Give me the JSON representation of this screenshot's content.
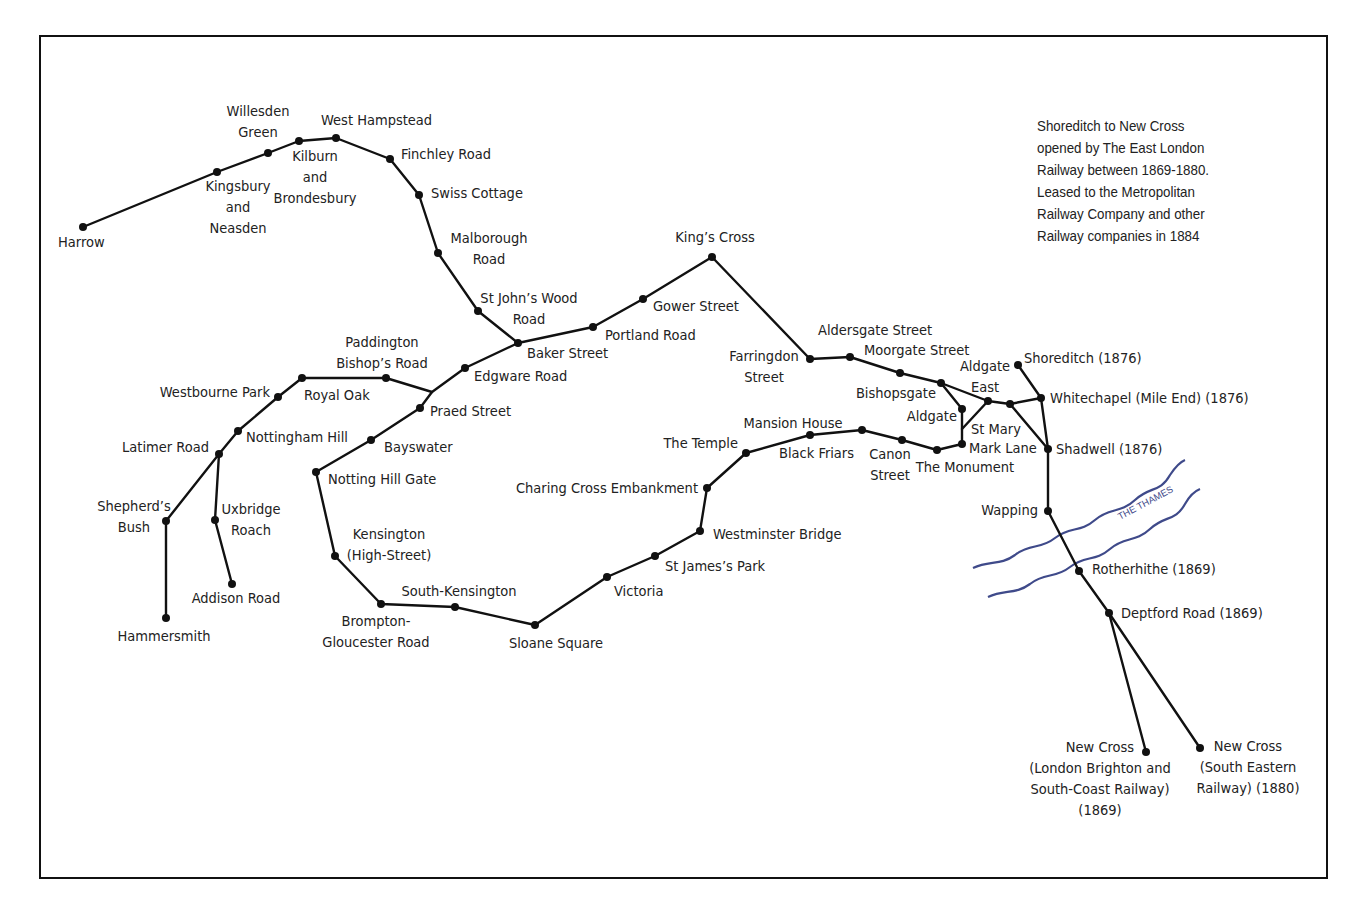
{
  "map": {
    "colors": {
      "line": "#111111",
      "river": "#3f4a8a",
      "text": "#222222",
      "frame": "#111111"
    },
    "note": {
      "lines": [
        "Shoreditch to New Cross",
        "opened by The East London",
        "Railway between 1869-1880.",
        "Leased to the Metropolitan",
        "Railway Company and other",
        "Railway companies in 1884"
      ]
    },
    "river": {
      "name": "THE THAMES",
      "label_x": 1120,
      "label_y": 520,
      "label_rotate": -28
    },
    "lines": [
      {
        "name": "harrow-branch",
        "points": [
          [
            83,
            227
          ],
          [
            217,
            172
          ],
          [
            268,
            153
          ],
          [
            299,
            141
          ],
          [
            336,
            138
          ],
          [
            390,
            159
          ],
          [
            419,
            195
          ],
          [
            438,
            253
          ],
          [
            478,
            311
          ],
          [
            518,
            343
          ]
        ]
      },
      {
        "name": "north-route",
        "points": [
          [
            518,
            343
          ],
          [
            593,
            327
          ],
          [
            643,
            299
          ],
          [
            712,
            257
          ],
          [
            810,
            359
          ],
          [
            850,
            357
          ],
          [
            900,
            373
          ],
          [
            941,
            383
          ],
          [
            988,
            401
          ],
          [
            1010,
            404
          ],
          [
            1041,
            398
          ]
        ]
      },
      {
        "name": "west-route",
        "points": [
          [
            518,
            343
          ],
          [
            465,
            368
          ],
          [
            432,
            392
          ],
          [
            420,
            408
          ],
          [
            371,
            440
          ],
          [
            316,
            472
          ],
          [
            335,
            556
          ],
          [
            381,
            604
          ],
          [
            455,
            607
          ],
          [
            535,
            625
          ],
          [
            607,
            577
          ],
          [
            655,
            556
          ],
          [
            700,
            531
          ],
          [
            707,
            488
          ],
          [
            746,
            453
          ],
          [
            810,
            435
          ],
          [
            862,
            430
          ],
          [
            902,
            440
          ],
          [
            937,
            450
          ],
          [
            962,
            444
          ],
          [
            962,
            409
          ],
          [
            941,
            383
          ]
        ]
      },
      {
        "name": "paddington-link",
        "points": [
          [
            432,
            392
          ],
          [
            386,
            378
          ],
          [
            302,
            378
          ],
          [
            278,
            397
          ],
          [
            238,
            431
          ],
          [
            219,
            454
          ],
          [
            166,
            521
          ],
          [
            166,
            618
          ]
        ]
      },
      {
        "name": "addison-branch",
        "points": [
          [
            219,
            454
          ],
          [
            215,
            520
          ],
          [
            232,
            584
          ]
        ]
      },
      {
        "name": "st-mary-link",
        "points": [
          [
            962,
            429
          ],
          [
            988,
            401
          ]
        ]
      },
      {
        "name": "east-london-railway",
        "points": [
          [
            1018,
            365
          ],
          [
            1041,
            398
          ],
          [
            1048,
            449
          ],
          [
            1048,
            511
          ],
          [
            1079,
            571
          ],
          [
            1109,
            613
          ],
          [
            1200,
            748
          ]
        ]
      },
      {
        "name": "shadwell-link",
        "points": [
          [
            1010,
            404
          ],
          [
            1048,
            449
          ]
        ]
      },
      {
        "name": "lbscr-branch",
        "points": [
          [
            1109,
            613
          ],
          [
            1146,
            752
          ]
        ]
      }
    ],
    "stations": [
      {
        "name": "Harrow",
        "x": 83,
        "y": 227,
        "lx": 58,
        "ly": 247,
        "lines": [
          "Harrow"
        ],
        "anchor": "start"
      },
      {
        "name": "Kingsbury and Neasden",
        "x": 217,
        "y": 172,
        "lx": 238,
        "ly": 191,
        "lines": [
          "Kingsbury",
          "and",
          "Neasden"
        ],
        "anchor": "middle"
      },
      {
        "name": "Willesden Green",
        "x": 268,
        "y": 153,
        "lx": 258,
        "ly": 116,
        "lines": [
          "Willesden",
          "Green"
        ],
        "anchor": "middle"
      },
      {
        "name": "Kilburn and Brondesbury",
        "x": 299,
        "y": 141,
        "lx": 315,
        "ly": 161,
        "lines": [
          "Kilburn",
          "and",
          "Brondesbury"
        ],
        "anchor": "middle"
      },
      {
        "name": "West Hampstead",
        "x": 336,
        "y": 138,
        "lx": 321,
        "ly": 125,
        "lines": [
          "West Hampstead"
        ],
        "anchor": "start"
      },
      {
        "name": "Finchley Road",
        "x": 390,
        "y": 159,
        "lx": 401,
        "ly": 159,
        "lines": [
          "Finchley Road"
        ],
        "anchor": "start"
      },
      {
        "name": "Swiss Cottage",
        "x": 419,
        "y": 195,
        "lx": 431,
        "ly": 198,
        "lines": [
          "Swiss Cottage"
        ],
        "anchor": "start"
      },
      {
        "name": "Malborough Road",
        "x": 438,
        "y": 253,
        "lx": 489,
        "ly": 243,
        "lines": [
          "Malborough",
          "Road"
        ],
        "anchor": "middle"
      },
      {
        "name": "St John's Wood Road",
        "x": 478,
        "y": 311,
        "lx": 529,
        "ly": 303,
        "lines": [
          "St John’s Wood",
          "Road"
        ],
        "anchor": "middle"
      },
      {
        "name": "Baker Street",
        "x": 518,
        "y": 343,
        "lx": 527,
        "ly": 358,
        "lines": [
          "Baker Street"
        ],
        "anchor": "start"
      },
      {
        "name": "Portland Road",
        "x": 593,
        "y": 327,
        "lx": 605,
        "ly": 340,
        "lines": [
          "Portland Road"
        ],
        "anchor": "start"
      },
      {
        "name": "Gower Street",
        "x": 643,
        "y": 299,
        "lx": 653,
        "ly": 311,
        "lines": [
          "Gower Street"
        ],
        "anchor": "start"
      },
      {
        "name": "King's Cross",
        "x": 712,
        "y": 257,
        "lx": 715,
        "ly": 242,
        "lines": [
          "King’s Cross"
        ],
        "anchor": "middle"
      },
      {
        "name": "Farringdon Street",
        "x": 810,
        "y": 359,
        "lx": 764,
        "ly": 361,
        "lines": [
          "Farringdon",
          "Street"
        ],
        "anchor": "middle"
      },
      {
        "name": "Aldersgate Street",
        "x": 850,
        "y": 357,
        "lx": 818,
        "ly": 335,
        "lines": [
          "Aldersgate Street"
        ],
        "anchor": "start"
      },
      {
        "name": "Moorgate Street",
        "x": 900,
        "y": 373,
        "lx": 864,
        "ly": 355,
        "lines": [
          "Moorgate Street"
        ],
        "anchor": "start"
      },
      {
        "name": "Bishopsgate",
        "x": 941,
        "y": 383,
        "lx": 936,
        "ly": 398,
        "lines": [
          "Bishopsgate"
        ],
        "anchor": "end"
      },
      {
        "name": "Aldgate",
        "x": 962,
        "y": 409,
        "lx": 957,
        "ly": 421,
        "lines": [
          "Aldgate"
        ],
        "anchor": "end"
      },
      {
        "name": "Aldgate East",
        "x": 988,
        "y": 401,
        "lx": 985,
        "ly": 371,
        "lines": [
          "Aldgate",
          "East"
        ],
        "anchor": "middle"
      },
      {
        "name": "St Mary",
        "x": 1010,
        "y": 404,
        "lx": 971,
        "ly": 434,
        "lines": [
          "St Mary"
        ],
        "anchor": "start"
      },
      {
        "name": "Mark Lane",
        "x": 962,
        "y": 444,
        "lx": 969,
        "ly": 453,
        "lines": [
          "Mark Lane"
        ],
        "anchor": "start"
      },
      {
        "name": "The Monument",
        "x": 937,
        "y": 450,
        "lx": 965,
        "ly": 472,
        "lines": [
          "The Monument"
        ],
        "anchor": "middle"
      },
      {
        "name": "Canon Street",
        "x": 902,
        "y": 440,
        "lx": 890,
        "ly": 459,
        "lines": [
          "Canon",
          "Street"
        ],
        "anchor": "middle"
      },
      {
        "name": "Mansion House",
        "x": 862,
        "y": 430,
        "lx": 793,
        "ly": 428,
        "lines": [
          "Mansion House"
        ],
        "anchor": "middle"
      },
      {
        "name": "Black Friars",
        "x": 810,
        "y": 435,
        "lx": 779,
        "ly": 458,
        "lines": [
          "Black Friars"
        ],
        "anchor": "start"
      },
      {
        "name": "The Temple",
        "x": 746,
        "y": 453,
        "lx": 738,
        "ly": 448,
        "lines": [
          "The Temple"
        ],
        "anchor": "end"
      },
      {
        "name": "Charing Cross Embankment",
        "x": 707,
        "y": 488,
        "lx": 698,
        "ly": 493,
        "lines": [
          "Charing Cross Embankment"
        ],
        "anchor": "end"
      },
      {
        "name": "Westminster Bridge",
        "x": 700,
        "y": 531,
        "lx": 713,
        "ly": 539,
        "lines": [
          "Westminster Bridge"
        ],
        "anchor": "start"
      },
      {
        "name": "St James's Park",
        "x": 655,
        "y": 556,
        "lx": 665,
        "ly": 571,
        "lines": [
          "St James’s Park"
        ],
        "anchor": "start"
      },
      {
        "name": "Victoria",
        "x": 607,
        "y": 577,
        "lx": 614,
        "ly": 596,
        "lines": [
          "Victoria"
        ],
        "anchor": "start"
      },
      {
        "name": "Sloane Square",
        "x": 535,
        "y": 625,
        "lx": 556,
        "ly": 648,
        "lines": [
          "Sloane Square"
        ],
        "anchor": "middle"
      },
      {
        "name": "South-Kensington",
        "x": 455,
        "y": 607,
        "lx": 459,
        "ly": 596,
        "lines": [
          "South-Kensington"
        ],
        "anchor": "middle"
      },
      {
        "name": "Brompton-Gloucester Road",
        "x": 381,
        "y": 604,
        "lx": 376,
        "ly": 626,
        "lines": [
          "Brompton-",
          "Gloucester Road"
        ],
        "anchor": "middle"
      },
      {
        "name": "Kensington (High-Street)",
        "x": 335,
        "y": 556,
        "lx": 389,
        "ly": 539,
        "lines": [
          "Kensington",
          "(High-Street)"
        ],
        "anchor": "middle"
      },
      {
        "name": "Notting Hill Gate",
        "x": 316,
        "y": 472,
        "lx": 328,
        "ly": 484,
        "lines": [
          "Notting Hill Gate"
        ],
        "anchor": "start"
      },
      {
        "name": "Bayswater",
        "x": 371,
        "y": 440,
        "lx": 384,
        "ly": 452,
        "lines": [
          "Bayswater"
        ],
        "anchor": "start"
      },
      {
        "name": "Praed Street",
        "x": 420,
        "y": 408,
        "lx": 430,
        "ly": 416,
        "lines": [
          "Praed Street"
        ],
        "anchor": "start"
      },
      {
        "name": "Edgware Road",
        "x": 465,
        "y": 368,
        "lx": 474,
        "ly": 381,
        "lines": [
          "Edgware Road"
        ],
        "anchor": "start"
      },
      {
        "name": "Paddington Bishop's Road",
        "x": 386,
        "y": 378,
        "lx": 382,
        "ly": 347,
        "lines": [
          "Paddington",
          "Bishop’s Road"
        ],
        "anchor": "middle"
      },
      {
        "name": "Royal Oak",
        "x": 302,
        "y": 378,
        "lx": 304,
        "ly": 400,
        "lines": [
          "Royal Oak"
        ],
        "anchor": "start"
      },
      {
        "name": "Westbourne Park",
        "x": 278,
        "y": 397,
        "lx": 270,
        "ly": 397,
        "lines": [
          "Westbourne Park"
        ],
        "anchor": "end"
      },
      {
        "name": "Nottingham Hill",
        "x": 238,
        "y": 431,
        "lx": 246,
        "ly": 442,
        "lines": [
          "Nottingham Hill"
        ],
        "anchor": "start"
      },
      {
        "name": "Latimer Road",
        "x": 219,
        "y": 454,
        "lx": 209,
        "ly": 452,
        "lines": [
          "Latimer Road"
        ],
        "anchor": "end"
      },
      {
        "name": "Shepherd's Bush",
        "x": 166,
        "y": 521,
        "lx": 134,
        "ly": 511,
        "lines": [
          "Shepherd’s",
          "Bush"
        ],
        "anchor": "middle"
      },
      {
        "name": "Hammersmith",
        "x": 166,
        "y": 618,
        "lx": 164,
        "ly": 641,
        "lines": [
          "Hammersmith"
        ],
        "anchor": "middle"
      },
      {
        "name": "Uxbridge Roach",
        "x": 215,
        "y": 520,
        "lx": 251,
        "ly": 514,
        "lines": [
          "Uxbridge",
          "Roach"
        ],
        "anchor": "middle"
      },
      {
        "name": "Addison Road",
        "x": 232,
        "y": 584,
        "lx": 236,
        "ly": 603,
        "lines": [
          "Addison Road"
        ],
        "anchor": "middle"
      },
      {
        "name": "Shoreditch (1876)",
        "x": 1018,
        "y": 365,
        "lx": 1024,
        "ly": 363,
        "lines": [
          "Shoreditch (1876)"
        ],
        "anchor": "start"
      },
      {
        "name": "Whitechapel (Mile End) (1876)",
        "x": 1041,
        "y": 398,
        "lx": 1050,
        "ly": 403,
        "lines": [
          "Whitechapel (Mile End) (1876)"
        ],
        "anchor": "start"
      },
      {
        "name": "Shadwell (1876)",
        "x": 1048,
        "y": 449,
        "lx": 1056,
        "ly": 454,
        "lines": [
          "Shadwell (1876)"
        ],
        "anchor": "start"
      },
      {
        "name": "Wapping",
        "x": 1048,
        "y": 511,
        "lx": 1038,
        "ly": 515,
        "lines": [
          "Wapping"
        ],
        "anchor": "end"
      },
      {
        "name": "Rotherhithe (1869)",
        "x": 1079,
        "y": 571,
        "lx": 1092,
        "ly": 574,
        "lines": [
          "Rotherhithe (1869)"
        ],
        "anchor": "start"
      },
      {
        "name": "Deptford Road (1869)",
        "x": 1109,
        "y": 613,
        "lx": 1121,
        "ly": 618,
        "lines": [
          "Deptford Road (1869)"
        ],
        "anchor": "start"
      },
      {
        "name": "New Cross (London Brighton and South-Coast Railway) (1869)",
        "x": 1146,
        "y": 752,
        "lx": 1100,
        "ly": 752,
        "lines": [
          "New Cross",
          "(London Brighton and",
          "South-Coast Railway)",
          "(1869)"
        ],
        "anchor": "middle"
      },
      {
        "name": "New Cross (South Eastern Railway) (1880)",
        "x": 1200,
        "y": 748,
        "lx": 1248,
        "ly": 751,
        "lines": [
          "New Cross",
          "(South Eastern",
          "Railway) (1880)"
        ],
        "anchor": "middle"
      }
    ]
  }
}
